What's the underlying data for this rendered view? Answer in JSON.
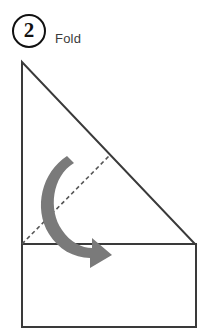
{
  "step": {
    "number": "2",
    "label": "Fold"
  },
  "colors": {
    "outline": "#3a3a3a",
    "badge_outline": "#111111",
    "fold_line": "#555555",
    "arrow_fill": "#7a7a7a",
    "paper_fill": "#ffffff",
    "label_text": "#3b3b3b",
    "background": "#ffffff"
  },
  "diagram": {
    "shapes": [
      {
        "name": "triangle-flap",
        "type": "polygon",
        "points": "22,12 22,194 195,194"
      },
      {
        "name": "base-rectangle",
        "type": "rect",
        "x": 22,
        "y": 194,
        "width": 174,
        "height": 83
      },
      {
        "name": "fold-line",
        "type": "dashed-line",
        "x1": 22,
        "y1": 194,
        "x2": 110,
        "y2": 105,
        "dash": "4 3"
      },
      {
        "name": "fold-direction-arrow",
        "type": "curved-arrow",
        "direction": "clockwise-down-right"
      }
    ]
  }
}
